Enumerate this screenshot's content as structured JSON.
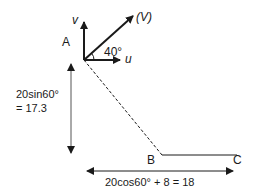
{
  "diagram": {
    "points": {
      "A": {
        "label": "A"
      },
      "B": {
        "label": "B"
      },
      "C": {
        "label": "C"
      }
    },
    "vectors": {
      "v": {
        "label": "v"
      },
      "u": {
        "label": "u"
      },
      "V": {
        "label": "(V)"
      },
      "angle": {
        "label": "40°"
      }
    },
    "dimensions": {
      "vertical": {
        "line1": "20sin60°",
        "line2": "= 17.3"
      },
      "horizontal": {
        "label": "20cos60° + 8 = 18"
      }
    },
    "colors": {
      "ink": "#1a1a1a",
      "dim_line": "#555555"
    }
  }
}
